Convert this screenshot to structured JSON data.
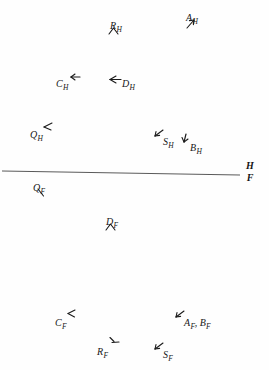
{
  "figure": {
    "background_color": "#fefefe",
    "ink_color": "#1a1a1a",
    "line_color": "#5a5a5a",
    "width": 269,
    "height": 370
  },
  "divider": {
    "name": "boundary-line",
    "label_above": "H",
    "label_below": "F",
    "x1": 2,
    "y1": 171,
    "x2": 240,
    "y2": 175
  },
  "markers": [
    {
      "id": "A_H",
      "base": "A",
      "sub": "H",
      "x": 186,
      "y": 8,
      "glyph": "arrow-up-right",
      "glyph_dx": 0,
      "glyph_dy": 11
    },
    {
      "id": "R_H",
      "base": "R",
      "sub": "H",
      "x": 110,
      "y": 16,
      "glyph": "chevron-up",
      "glyph_dx": -2,
      "glyph_dy": 11
    },
    {
      "id": "C_H",
      "base": "C",
      "sub": "H",
      "x": 56,
      "y": 74,
      "glyph": "arrow-left",
      "glyph_dx": 14,
      "glyph_dy": -1
    },
    {
      "id": "D_H",
      "base": "D",
      "sub": "H",
      "x": 122,
      "y": 74,
      "glyph": "arrow-left-long",
      "glyph_dx": -18,
      "glyph_dy": 1
    },
    {
      "id": "Q_H",
      "base": "Q",
      "sub": "H",
      "x": 30,
      "y": 125,
      "glyph": "tick-angle-ne",
      "glyph_dx": 13,
      "glyph_dy": -3
    },
    {
      "id": "S_H",
      "base": "S",
      "sub": "H",
      "x": 163,
      "y": 132,
      "glyph": "arrow-sw",
      "glyph_dx": -9,
      "glyph_dy": -3
    },
    {
      "id": "B_H",
      "base": "B",
      "sub": "H",
      "x": 190,
      "y": 138,
      "glyph": "arrow-down",
      "glyph_dx": -9,
      "glyph_dy": -5
    },
    {
      "id": "Q_F",
      "base": "Q",
      "sub": "F",
      "x": 33,
      "y": 178,
      "glyph": "stroke-se",
      "glyph_dx": 4,
      "glyph_dy": 10
    },
    {
      "id": "D_F",
      "base": "D",
      "sub": "F",
      "x": 106,
      "y": 212,
      "glyph": "chevron-up",
      "glyph_dx": -1,
      "glyph_dy": 11
    },
    {
      "id": "C_F",
      "base": "C",
      "sub": "F",
      "x": 55,
      "y": 313,
      "glyph": "angle-ne",
      "glyph_dx": 12,
      "glyph_dy": -4
    },
    {
      "id": "R_F",
      "base": "R",
      "sub": "F",
      "x": 97,
      "y": 342,
      "glyph": "stroke-ne",
      "glyph_dx": 12,
      "glyph_dy": -6
    },
    {
      "id": "S_F",
      "base": "S",
      "sub": "F",
      "x": 163,
      "y": 345,
      "glyph": "arrow-sw",
      "glyph_dx": -9,
      "glyph_dy": -3
    }
  ],
  "pair_label": {
    "id": "A_F_B_F",
    "text_a": "A",
    "sub_a": "F",
    "separator": ",",
    "text_b": "B",
    "sub_b": "F",
    "x": 184,
    "y": 313,
    "glyph": "arrow-sw",
    "glyph_dx": -9,
    "glyph_dy": -3
  }
}
